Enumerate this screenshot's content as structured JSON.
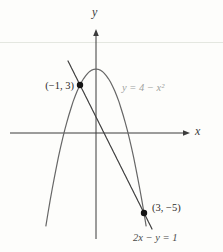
{
  "labels": {
    "y_axis": "y",
    "x_axis": "x",
    "parabola": "y = 4 − x²",
    "line": "2x − y = 1",
    "point1": "(−1, 3)",
    "point2": "(3, −5)"
  },
  "chart_data": {
    "type": "line",
    "title": "",
    "xlabel": "x",
    "ylabel": "y",
    "xlim": [
      -5.4,
      5.8
    ],
    "ylim": [
      -7.5,
      6.5
    ],
    "grid": false,
    "tick_labels_shown": false,
    "series": [
      {
        "name": "y = 4 − x²",
        "kind": "parabola",
        "coeffs": [
          4,
          0,
          -1
        ],
        "x_range": [
          -3.13,
          3.13
        ]
      },
      {
        "name": "2x − y = 1",
        "kind": "line-through-marked-points",
        "coeffs": [
          1,
          -2
        ],
        "x_range": [
          -1.75,
          3.5
        ]
      }
    ],
    "points": [
      {
        "x": -1,
        "y": 3,
        "label": "(−1, 3)"
      },
      {
        "x": 3,
        "y": -5,
        "label": "(3, −5)"
      }
    ]
  },
  "colors": {
    "axis_ink": "#3b3b3b",
    "line_ink": "#3f3f3f",
    "parabola_ink": "#666666",
    "label_muted": "#a0a39f",
    "point_dot": "#141414",
    "text_dark": "#2e2c2a",
    "equation_text": "#4a4a4a",
    "page_rule": "#e4e7e0",
    "background": "#fdfdfb"
  }
}
